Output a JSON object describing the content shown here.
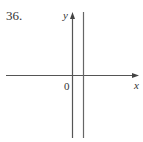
{
  "problem": {
    "number": "36."
  },
  "axes": {
    "x_label": "x",
    "y_label": "y",
    "origin_label": "0"
  },
  "graph": {
    "description": "Vertical line x = a, a small positive constant, drawn to the right of the y-axis",
    "line_color": "#666666",
    "axis_color": "#555555"
  }
}
